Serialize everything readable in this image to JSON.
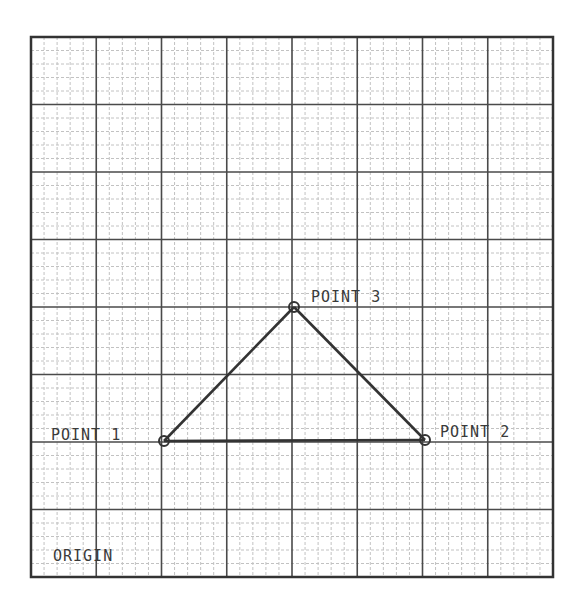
{
  "diagram": {
    "type": "graph-paper-triangle",
    "grid": {
      "columns": 8,
      "rows": 8,
      "minor_divisions": 5,
      "left": 31,
      "top": 37,
      "right": 553,
      "bottom": 577,
      "colors": {
        "border": "#333333",
        "major": "#4a4a4a",
        "minor": "#c2c2c2"
      }
    },
    "origin_label": "ORIGIN",
    "points": [
      {
        "id": "point-1",
        "label": "POINT 1",
        "grid": [
          2,
          2
        ],
        "px": [
          164,
          441
        ],
        "label_pos": [
          51,
          440
        ],
        "anchor": "start"
      },
      {
        "id": "point-2",
        "label": "POINT 2",
        "grid": [
          6,
          2
        ],
        "px": [
          425,
          440
        ],
        "label_pos": [
          440,
          437
        ],
        "anchor": "start"
      },
      {
        "id": "point-3",
        "label": "POINT 3",
        "grid": [
          4,
          4
        ],
        "px": [
          294,
          307
        ],
        "label_pos": [
          311,
          302
        ],
        "anchor": "start"
      }
    ],
    "edges": [
      [
        "point-1",
        "point-2"
      ],
      [
        "point-1",
        "point-3"
      ],
      [
        "point-2",
        "point-3"
      ]
    ],
    "line_color": "#333333"
  }
}
